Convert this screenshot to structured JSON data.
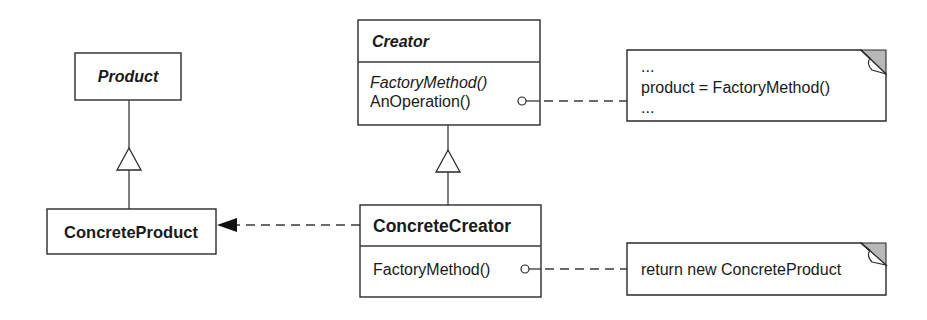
{
  "diagram": {
    "type": "UML class diagram",
    "classes": {
      "product": {
        "name": "Product",
        "abstract": true
      },
      "concrete_product": {
        "name": "ConcreteProduct",
        "abstract": false
      },
      "creator": {
        "name": "Creator",
        "abstract": true,
        "operations": [
          {
            "label": "FactoryMethod()",
            "abstract": true
          },
          {
            "label": "AnOperation()",
            "abstract": false
          }
        ]
      },
      "concrete_creator": {
        "name": "ConcreteCreator",
        "abstract": false,
        "operations": [
          {
            "label": "FactoryMethod()",
            "abstract": false
          }
        ]
      }
    },
    "notes": {
      "an_operation_note": {
        "lines": [
          "...",
          "product = FactoryMethod()",
          "..."
        ]
      },
      "factory_method_note": {
        "lines": [
          "return new ConcreteProduct"
        ]
      }
    },
    "relationships": [
      {
        "type": "generalization",
        "from": "ConcreteProduct",
        "to": "Product"
      },
      {
        "type": "generalization",
        "from": "ConcreteCreator",
        "to": "Creator"
      },
      {
        "type": "dependency",
        "from": "ConcreteCreator",
        "to": "ConcreteProduct"
      },
      {
        "type": "note-anchor",
        "from": "AnOperation()",
        "to": "an_operation_note"
      },
      {
        "type": "note-anchor",
        "from": "FactoryMethod()",
        "to": "factory_method_note"
      }
    ],
    "colors": {
      "line": "#2a2a2a",
      "background": "#ffffff",
      "note_fold": "#b8b8b8"
    }
  }
}
